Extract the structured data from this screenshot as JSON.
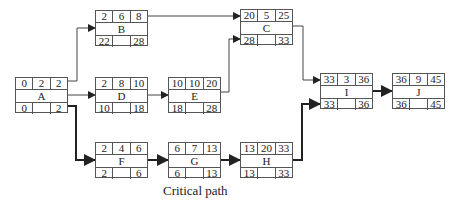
{
  "caption": "Critical path",
  "nodes": {
    "A": {
      "label": "A",
      "es": "0",
      "dur": "2",
      "ef": "2",
      "ls": "0",
      "lf": "2"
    },
    "B": {
      "label": "B",
      "es": "2",
      "dur": "6",
      "ef": "8",
      "ls": "22",
      "lf": "28"
    },
    "C": {
      "label": "C",
      "es": "20",
      "dur": "5",
      "ef": "25",
      "ls": "28",
      "lf": "33"
    },
    "D": {
      "label": "D",
      "es": "2",
      "dur": "8",
      "ef": "10",
      "ls": "10",
      "lf": "18"
    },
    "E": {
      "label": "E",
      "es": "10",
      "dur": "10",
      "ef": "20",
      "ls": "18",
      "lf": "28"
    },
    "F": {
      "label": "F",
      "es": "2",
      "dur": "4",
      "ef": "6",
      "ls": "2",
      "lf": "6"
    },
    "G": {
      "label": "G",
      "es": "6",
      "dur": "7",
      "ef": "13",
      "ls": "6",
      "lf": "13"
    },
    "H": {
      "label": "H",
      "es": "13",
      "dur": "20",
      "ef": "33",
      "ls": "13",
      "lf": "33"
    },
    "I": {
      "label": "I",
      "es": "33",
      "dur": "3",
      "ef": "36",
      "ls": "33",
      "lf": "36"
    },
    "J": {
      "label": "J",
      "es": "36",
      "dur": "9",
      "ef": "45",
      "ls": "36",
      "lf": "45"
    }
  },
  "edges": [
    {
      "from": "A",
      "to": "B",
      "critical": false
    },
    {
      "from": "A",
      "to": "D",
      "critical": false
    },
    {
      "from": "A",
      "to": "F",
      "critical": true
    },
    {
      "from": "B",
      "to": "C",
      "critical": false
    },
    {
      "from": "D",
      "to": "E",
      "critical": false
    },
    {
      "from": "E",
      "to": "C",
      "critical": false
    },
    {
      "from": "C",
      "to": "I",
      "critical": false
    },
    {
      "from": "F",
      "to": "G",
      "critical": true
    },
    {
      "from": "G",
      "to": "H",
      "critical": true
    },
    {
      "from": "H",
      "to": "I",
      "critical": true
    },
    {
      "from": "I",
      "to": "J",
      "critical": true
    }
  ]
}
